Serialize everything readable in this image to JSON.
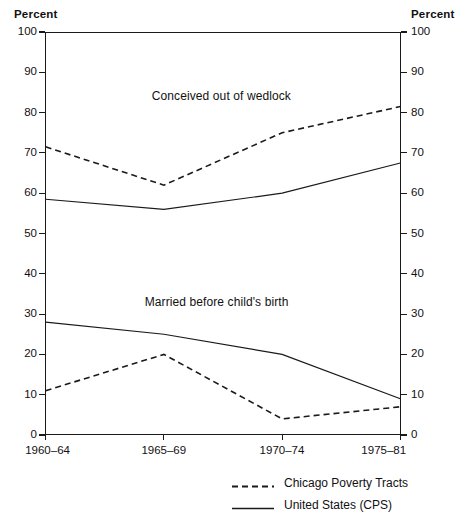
{
  "title_cropped": "Percent of Births Conceived Out of Wedlock",
  "axis_caption_left": "Percent",
  "axis_caption_right": "Percent",
  "annotations": [
    {
      "text": "Conceived out of wedlock",
      "x_frac": 0.3,
      "y_value": 84
    },
    {
      "text": "Married before child's birth",
      "x_frac": 0.28,
      "y_value": 33
    }
  ],
  "legend": [
    {
      "label": "Chicago Poverty Tracts",
      "style": "dashed"
    },
    {
      "label": "United States (CPS)",
      "style": "solid"
    }
  ],
  "chart_data": {
    "type": "line",
    "title": "Percent of Births Conceived Out of Wedlock",
    "xlabel": "",
    "ylabel": "Percent",
    "ylim": [
      0,
      100
    ],
    "ytick_step": 10,
    "yticks": [
      0,
      10,
      20,
      30,
      40,
      50,
      60,
      70,
      80,
      90,
      100
    ],
    "grid": false,
    "legend_position": "bottom-right",
    "dual_axis": true,
    "right_ylabel": "Percent",
    "categories": [
      "1960–64",
      "1965–69",
      "1970–74",
      "1975–81"
    ],
    "groups": [
      {
        "name": "Conceived out of wedlock",
        "series": [
          {
            "name": "Chicago Poverty Tracts",
            "style": "dashed",
            "values": [
              71.5,
              62,
              75,
              81.5
            ]
          },
          {
            "name": "United States (CPS)",
            "style": "solid",
            "values": [
              58.5,
              56,
              60,
              67.5
            ]
          }
        ]
      },
      {
        "name": "Married before child's birth",
        "series": [
          {
            "name": "Chicago Poverty Tracts",
            "style": "dashed",
            "values": [
              11,
              20,
              4,
              7
            ]
          },
          {
            "name": "United States (CPS)",
            "style": "solid",
            "values": [
              28,
              25,
              20,
              9
            ]
          }
        ]
      }
    ]
  },
  "colors": {
    "ink": "#1a1a1a",
    "background": "#ffffff"
  }
}
